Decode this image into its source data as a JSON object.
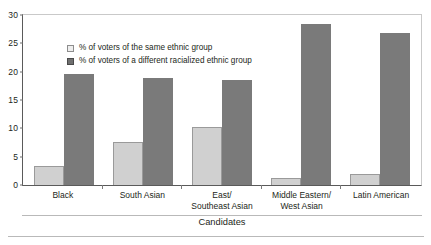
{
  "chart_data": {
    "type": "bar",
    "title": "",
    "xlabel": "Candidates",
    "ylabel": "",
    "ylim": [
      0,
      30
    ],
    "yticks": [
      0,
      5,
      10,
      15,
      20,
      25,
      30
    ],
    "grid": false,
    "legend_position": "top-left inside plot area",
    "categories": [
      "Black",
      "East/\nSoutheast Asian",
      "South Asian",
      "Middle Eastern/\nWest Asian",
      "Latin American"
    ],
    "category_lines": [
      [
        "Black"
      ],
      [
        "South Asian"
      ],
      [
        "East/",
        "Southeast Asian"
      ],
      [
        "Middle Eastern/",
        "West Asian"
      ],
      [
        "Latin American"
      ]
    ],
    "series": [
      {
        "name": "% of voters of the same ethnic group",
        "color": "#d0d0d0",
        "values": [
          3.3,
          7.6,
          10.3,
          1.3,
          2.0
        ]
      },
      {
        "name": "% of voters of a different racialized ethnic group",
        "color": "#7a7a7a",
        "values": [
          19.6,
          18.9,
          18.5,
          28.5,
          26.9
        ]
      }
    ]
  },
  "colors": {
    "series_light": "#d0d0d0",
    "series_dark": "#7a7a7a",
    "axis": "#5a5a5a",
    "frame": "#c9c9c9",
    "text": "#231f20"
  }
}
